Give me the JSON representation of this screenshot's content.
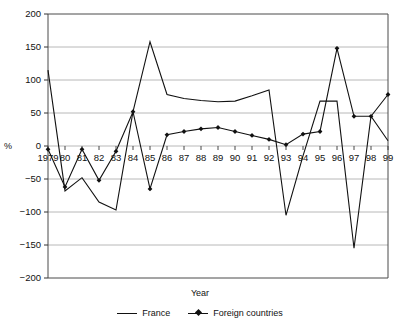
{
  "chart_data": {
    "type": "line",
    "title": "",
    "xlabel": "Year",
    "ylabel": "%",
    "ylim": [
      -200,
      200
    ],
    "ytick_step": 50,
    "yticks": [
      200,
      150,
      100,
      50,
      0,
      -50,
      -100,
      -150,
      -200
    ],
    "ytick_labels": [
      "200",
      "150",
      "100",
      "50",
      "0",
      "−50",
      "−100",
      "−150",
      "−200"
    ],
    "grid": true,
    "grid_axis": "y",
    "legend_position": "bottom",
    "categories": [
      "1979",
      "80",
      "81",
      "82",
      "83",
      "84",
      "85",
      "86",
      "87",
      "88",
      "89",
      "90",
      "91",
      "92",
      "93",
      "94",
      "95",
      "96",
      "97",
      "98",
      "99"
    ],
    "x": [
      1979,
      1980,
      1981,
      1982,
      1983,
      1984,
      1985,
      1986,
      1987,
      1988,
      1989,
      1990,
      1991,
      1992,
      1993,
      1994,
      1995,
      1996,
      1997,
      1998,
      1999
    ],
    "series": [
      {
        "name": "France",
        "marker": "none",
        "color": "#111111",
        "values": [
          115,
          -68,
          -48,
          -85,
          -97,
          52,
          158,
          78,
          72,
          69,
          67,
          68,
          76,
          85,
          -105,
          -15,
          68,
          68,
          -155,
          45,
          8
        ]
      },
      {
        "name": "Foreign countries",
        "marker": "diamond",
        "color": "#111111",
        "values": [
          -5,
          -62,
          -5,
          -52,
          -8,
          52,
          -65,
          17,
          22,
          26,
          28,
          22,
          16,
          10,
          2,
          18,
          22,
          148,
          45,
          45,
          78
        ]
      }
    ]
  },
  "axes": {
    "y_title": "%",
    "x_title": "Year"
  },
  "legend": {
    "items": [
      {
        "label": "France",
        "marker": "line"
      },
      {
        "label": "Foreign countries",
        "marker": "line-with-diamond"
      }
    ]
  }
}
